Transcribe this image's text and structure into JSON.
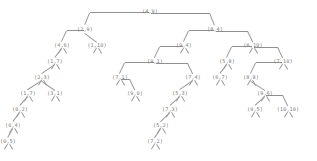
{
  "diagram": {
    "kind": "binary-tree",
    "title": "",
    "node_label_format": "(x,y)",
    "colors": {
      "background": "#ffffff",
      "node_text": "#7c7c7c",
      "edge": "#9a9a9a"
    },
    "nodes": [
      {
        "id": "n0",
        "label": "(4,9)",
        "x": 150,
        "y": 8,
        "depth": 0
      },
      {
        "id": "n1",
        "label": "(2,9)",
        "x": 85,
        "y": 26,
        "depth": 1
      },
      {
        "id": "n2",
        "label": "(8,4)",
        "x": 215,
        "y": 26,
        "depth": 1
      },
      {
        "id": "n3",
        "label": "(4,6)",
        "x": 62,
        "y": 42,
        "depth": 2
      },
      {
        "id": "n4",
        "label": "(1,10)",
        "x": 97,
        "y": 42,
        "depth": 2
      },
      {
        "id": "n5",
        "label": "(9,4)",
        "x": 184,
        "y": 42,
        "depth": 2
      },
      {
        "id": "n6",
        "label": "(6,10)",
        "x": 253,
        "y": 42,
        "depth": 2
      },
      {
        "id": "n7",
        "label": "(1,7)",
        "x": 55,
        "y": 58,
        "depth": 3
      },
      {
        "id": "n8",
        "label": "(9,1)",
        "x": 155,
        "y": 58,
        "depth": 3
      },
      {
        "id": "n9",
        "label": "(5,8)",
        "x": 227,
        "y": 58,
        "depth": 3
      },
      {
        "id": "n10",
        "label": "(7,10)",
        "x": 283,
        "y": 58,
        "depth": 3
      },
      {
        "id": "n11",
        "label": "(2,3)",
        "x": 42,
        "y": 74,
        "depth": 4
      },
      {
        "id": "n12",
        "label": "(7,1)",
        "x": 120,
        "y": 74,
        "depth": 4
      },
      {
        "id": "n13",
        "label": "(7,4)",
        "x": 193,
        "y": 74,
        "depth": 4
      },
      {
        "id": "n14",
        "label": "(6,7)",
        "x": 220,
        "y": 74,
        "depth": 4
      },
      {
        "id": "n15",
        "label": "(8,8)",
        "x": 251,
        "y": 74,
        "depth": 4
      },
      {
        "id": "n16",
        "label": "(1,7)",
        "x": 28,
        "y": 90,
        "depth": 5
      },
      {
        "id": "n17",
        "label": "(3,1)",
        "x": 55,
        "y": 90,
        "depth": 5
      },
      {
        "id": "n18",
        "label": "(9,0)",
        "x": 135,
        "y": 90,
        "depth": 5
      },
      {
        "id": "n19",
        "label": "(5,3)",
        "x": 180,
        "y": 90,
        "depth": 5
      },
      {
        "id": "n20",
        "label": "(9,6)",
        "x": 265,
        "y": 90,
        "depth": 5
      },
      {
        "id": "n21",
        "label": "(0,2)",
        "x": 20,
        "y": 106,
        "depth": 6
      },
      {
        "id": "n22",
        "label": "(7,3)",
        "x": 170,
        "y": 106,
        "depth": 6
      },
      {
        "id": "n23",
        "label": "(9,5)",
        "x": 255,
        "y": 106,
        "depth": 6
      },
      {
        "id": "n24",
        "label": "(10,10)",
        "x": 288,
        "y": 106,
        "depth": 6
      },
      {
        "id": "n25",
        "label": "(0,4)",
        "x": 13,
        "y": 122,
        "depth": 7
      },
      {
        "id": "n26",
        "label": "(5,2)",
        "x": 161,
        "y": 122,
        "depth": 7
      },
      {
        "id": "n27",
        "label": "(0,5)",
        "x": 8,
        "y": 138,
        "depth": 8
      },
      {
        "id": "n28",
        "label": "(7,2)",
        "x": 155,
        "y": 138,
        "depth": 8
      }
    ],
    "edges": [
      {
        "from": "n0",
        "to": "n1"
      },
      {
        "from": "n0",
        "to": "n2"
      },
      {
        "from": "n1",
        "to": "n3"
      },
      {
        "from": "n1",
        "to": "n4"
      },
      {
        "from": "n2",
        "to": "n5"
      },
      {
        "from": "n2",
        "to": "n6"
      },
      {
        "from": "n3",
        "to": "n7"
      },
      {
        "from": "n5",
        "to": "n8"
      },
      {
        "from": "n6",
        "to": "n9"
      },
      {
        "from": "n6",
        "to": "n10"
      },
      {
        "from": "n7",
        "to": "n11"
      },
      {
        "from": "n8",
        "to": "n12"
      },
      {
        "from": "n8",
        "to": "n13"
      },
      {
        "from": "n9",
        "to": "n14"
      },
      {
        "from": "n10",
        "to": "n15"
      },
      {
        "from": "n11",
        "to": "n16"
      },
      {
        "from": "n11",
        "to": "n17"
      },
      {
        "from": "n12",
        "to": "n18"
      },
      {
        "from": "n13",
        "to": "n19"
      },
      {
        "from": "n15",
        "to": "n20"
      },
      {
        "from": "n16",
        "to": "n21"
      },
      {
        "from": "n19",
        "to": "n22"
      },
      {
        "from": "n20",
        "to": "n23"
      },
      {
        "from": "n20",
        "to": "n24"
      },
      {
        "from": "n21",
        "to": "n25"
      },
      {
        "from": "n22",
        "to": "n26"
      },
      {
        "from": "n25",
        "to": "n27"
      },
      {
        "from": "n26",
        "to": "n28"
      }
    ],
    "leaf_stubs": [
      {
        "x": 62,
        "y": 48
      },
      {
        "x": 97,
        "y": 48
      },
      {
        "x": 55,
        "y": 64
      },
      {
        "x": 184,
        "y": 48
      },
      {
        "x": 253,
        "y": 48
      },
      {
        "x": 42,
        "y": 80
      },
      {
        "x": 120,
        "y": 80
      },
      {
        "x": 193,
        "y": 80
      },
      {
        "x": 227,
        "y": 64
      },
      {
        "x": 283,
        "y": 64
      },
      {
        "x": 28,
        "y": 96
      },
      {
        "x": 55,
        "y": 96
      },
      {
        "x": 135,
        "y": 96
      },
      {
        "x": 180,
        "y": 96
      },
      {
        "x": 220,
        "y": 80
      },
      {
        "x": 251,
        "y": 80
      },
      {
        "x": 20,
        "y": 112
      },
      {
        "x": 170,
        "y": 112
      },
      {
        "x": 265,
        "y": 96
      },
      {
        "x": 13,
        "y": 128
      },
      {
        "x": 161,
        "y": 128
      },
      {
        "x": 255,
        "y": 112
      },
      {
        "x": 288,
        "y": 112
      },
      {
        "x": 8,
        "y": 144
      },
      {
        "x": 155,
        "y": 144
      }
    ]
  }
}
